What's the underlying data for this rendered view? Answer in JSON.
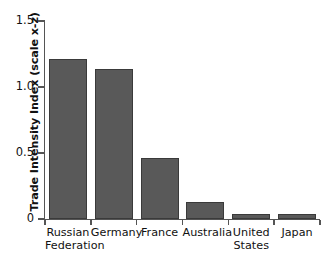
{
  "chart_data": {
    "type": "bar",
    "title": "",
    "xlabel": "",
    "ylabel": "Trade Intensity Index (scale x-z)",
    "categories": [
      "Russian Federation",
      "Germany",
      "France",
      "Australia",
      "United States",
      "Japan"
    ],
    "values": [
      1.21,
      1.14,
      0.46,
      0.13,
      0.04,
      0.04
    ],
    "ylim": [
      0,
      1.5
    ],
    "yticks": [
      0,
      0.5,
      1.0,
      1.5
    ],
    "ytick_labels": [
      "0",
      "0.5",
      "1.0",
      "1.5"
    ],
    "grid": false,
    "legend": false,
    "bar_color": "#595959",
    "bar_edge_color": "#3a3a3a",
    "axis_color": "#555555",
    "background_color": "#ffffff"
  },
  "axis": {
    "y_title": "Trade Intensity Index (scale x-z)",
    "ticks": [
      {
        "label": "1.5",
        "value": 1.5
      },
      {
        "label": "1.0",
        "value": 1.0
      },
      {
        "label": "0.5",
        "value": 0.5
      },
      {
        "label": "0",
        "value": 0
      }
    ]
  },
  "bars": [
    {
      "label": "Russian\nFederation",
      "value": 1.21
    },
    {
      "label": "Germany",
      "value": 1.14
    },
    {
      "label": "France",
      "value": 0.46
    },
    {
      "label": "Australia",
      "value": 0.13
    },
    {
      "label": "United\nStates",
      "value": 0.04
    },
    {
      "label": "Japan",
      "value": 0.04
    }
  ]
}
